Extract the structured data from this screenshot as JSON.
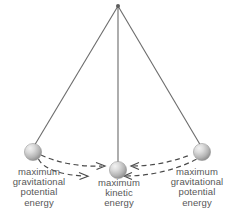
{
  "figure": {
    "background_color": "#ffffff",
    "string_color": "#6b6b6b",
    "bob_color": "#b9b9b9",
    "bob_highlight_color": "#ededed",
    "bob_shadow_color": "#8d8d8d",
    "text_color": "#575757",
    "arrow_color": "#4a4a4a"
  },
  "pivot": {
    "x": 118,
    "y": 6
  },
  "bobs": [
    {
      "id": "bob-left",
      "x": 33,
      "y": 152,
      "r": 8.5
    },
    {
      "id": "bob-center",
      "x": 118,
      "y": 169,
      "r": 8.5
    },
    {
      "id": "bob-right",
      "x": 202,
      "y": 152,
      "r": 8.5
    }
  ],
  "strings": [
    {
      "id": "string-left",
      "x1": 118,
      "y1": 6,
      "x2": 33,
      "y2": 147
    },
    {
      "id": "string-center",
      "x1": 118,
      "y1": 6,
      "x2": 118,
      "y2": 163
    },
    {
      "id": "string-right",
      "x1": 118,
      "y1": 6,
      "x2": 202,
      "y2": 147
    }
  ],
  "labels": {
    "left": {
      "lines": [
        "maximum",
        "gravitational",
        "potential",
        "energy"
      ],
      "line1": "maximum",
      "line2": "gravitational",
      "line3": "potential",
      "line4": "energy"
    },
    "center": {
      "lines": [
        "maximum",
        "kinetic",
        "energy"
      ],
      "line1": "maximum",
      "line2": "kinetic",
      "line3": "energy"
    },
    "right": {
      "lines": [
        "maximum",
        "gravitational",
        "potential",
        "energy"
      ],
      "line1": "maximum",
      "line2": "gravitational",
      "line3": "potential",
      "line4": "energy"
    }
  },
  "motion_arrows": [
    {
      "id": "arrow-left-upper",
      "direction": "right",
      "description": "dashed arc from left bob toward center bob, upper path"
    },
    {
      "id": "arrow-left-lower",
      "direction": "right",
      "description": "dashed arc from left toward center bob, lower path"
    },
    {
      "id": "arrow-right-upper",
      "direction": "right",
      "description": "dashed arc from center bob toward right bob, upper path"
    },
    {
      "id": "arrow-right-lower",
      "direction": "left",
      "description": "dashed arc from right bob back toward center bob, lower path"
    }
  ]
}
